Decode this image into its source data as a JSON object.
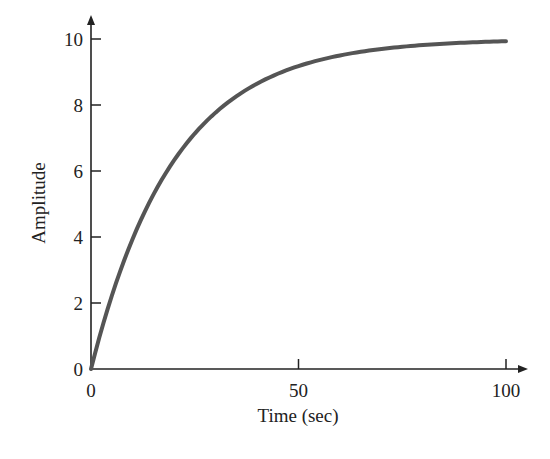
{
  "chart_data": {
    "type": "line",
    "title": "",
    "xlabel": "Time (sec)",
    "ylabel": "Amplitude",
    "xlim": [
      0,
      100
    ],
    "ylim": [
      0,
      10
    ],
    "grid": false,
    "legend": null,
    "x_ticks": [
      0,
      50,
      100
    ],
    "y_ticks": [
      0,
      2,
      4,
      6,
      8,
      10
    ],
    "x_tick_labels": [
      "0",
      "50",
      "100"
    ],
    "y_tick_labels": [
      "0",
      "2",
      "4",
      "6",
      "8",
      "10"
    ],
    "series": [
      {
        "name": "step response",
        "description": "First-order step response, approx 10*(1 - exp(-t/20))",
        "x": [
          0,
          5,
          10,
          15,
          20,
          25,
          30,
          35,
          40,
          45,
          50,
          55,
          60,
          65,
          70,
          75,
          80,
          85,
          90,
          95,
          100
        ],
        "values": [
          0,
          2.21,
          3.93,
          5.28,
          6.32,
          7.13,
          7.77,
          8.26,
          8.65,
          8.95,
          9.18,
          9.36,
          9.5,
          9.61,
          9.7,
          9.76,
          9.82,
          9.86,
          9.89,
          9.91,
          9.93
        ],
        "color": "#555555"
      }
    ]
  },
  "axes": {
    "xlabel": "Time (sec)",
    "ylabel": "Amplitude",
    "x_tick_labels": [
      "0",
      "50",
      "100"
    ],
    "y_tick_labels": [
      "0",
      "2",
      "4",
      "6",
      "8",
      "10"
    ]
  }
}
